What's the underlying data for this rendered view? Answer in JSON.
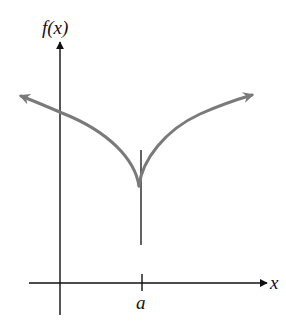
{
  "diagram": {
    "type": "function-graph",
    "labels": {
      "y_axis": "f(x)",
      "x_axis": "x",
      "tick": "a"
    },
    "colors": {
      "axes": "#111111",
      "curve": "#7a7a7a",
      "tangent": "#222222",
      "background": "#ffffff"
    },
    "features": {
      "cusp_at": "a",
      "vertical_tangent_at_cusp": true,
      "left_branch_arrow": true,
      "right_branch_arrow": true
    }
  }
}
